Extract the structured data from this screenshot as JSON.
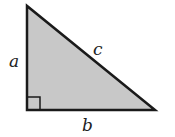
{
  "diagram": {
    "type": "right-triangle",
    "fill": "#c8c8c8",
    "stroke": "#1a1a1a",
    "labels": {
      "vertical_side": "a",
      "base_side": "b",
      "hypotenuse": "c"
    },
    "right_angle_marker": true
  }
}
